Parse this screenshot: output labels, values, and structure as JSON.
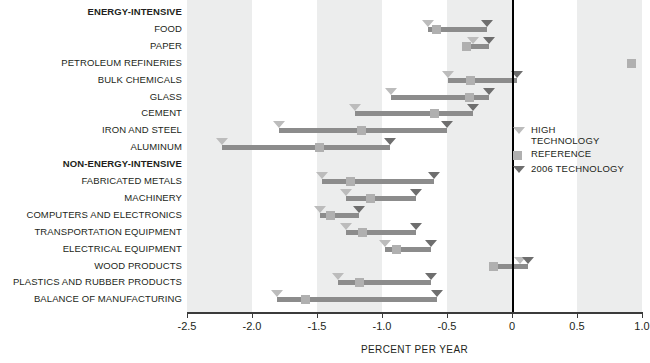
{
  "chart_data": {
    "type": "bar",
    "title": "",
    "xlabel": "PERCENT PER YEAR",
    "ylabel": "",
    "xlim": [
      -2.5,
      1.0
    ],
    "xticks": [
      -2.5,
      -2.0,
      -1.5,
      -1.0,
      -0.5,
      0,
      0.5,
      1.0
    ],
    "xticklabels": [
      "-2.5",
      "-2.0",
      "-1.5",
      "-1.0",
      "-0.5",
      "0",
      "0.5",
      "1.0"
    ],
    "grid": false,
    "legend_position": "right-middle",
    "series_names": [
      "HIGH TECHNOLOGY",
      "REFERENCE",
      "2006 TECHNOLOGY"
    ],
    "categories": [
      {
        "label": "ENERGY-INTENSIVE",
        "group": true
      },
      {
        "label": "FOOD",
        "group": false,
        "high": -0.65,
        "reference": -0.58,
        "tech2006": -0.19
      },
      {
        "label": "PAPER",
        "group": false,
        "high": -0.3,
        "reference": -0.35,
        "tech2006": -0.18
      },
      {
        "label": "PETROLEUM REFINERIES",
        "group": false,
        "high": null,
        "reference": 0.92,
        "tech2006": null
      },
      {
        "label": "BULK CHEMICALS",
        "group": false,
        "high": -0.49,
        "reference": -0.32,
        "tech2006": 0.04
      },
      {
        "label": "GLASS",
        "group": false,
        "high": -0.93,
        "reference": -0.33,
        "tech2006": -0.18
      },
      {
        "label": "CEMENT",
        "group": false,
        "high": -1.21,
        "reference": -0.6,
        "tech2006": -0.3
      },
      {
        "label": "IRON AND STEEL",
        "group": false,
        "high": -1.79,
        "reference": -1.16,
        "tech2006": -0.5
      },
      {
        "label": "ALUMINUM",
        "group": false,
        "high": -2.23,
        "reference": -1.48,
        "tech2006": -0.94
      },
      {
        "label": "NON-ENERGY-INTENSIVE",
        "group": true
      },
      {
        "label": "FABRICATED METALS",
        "group": false,
        "high": -1.46,
        "reference": -1.24,
        "tech2006": -0.6
      },
      {
        "label": "MACHINERY",
        "group": false,
        "high": -1.28,
        "reference": -1.09,
        "tech2006": -0.74
      },
      {
        "label": "COMPUTERS AND ELECTRONICS",
        "group": false,
        "high": -1.48,
        "reference": -1.4,
        "tech2006": -1.18
      },
      {
        "label": "TRANSPORTATION EQUIPMENT",
        "group": false,
        "high": -1.28,
        "reference": -1.15,
        "tech2006": -0.74
      },
      {
        "label": "ELECTRICAL EQUIPMENT",
        "group": false,
        "high": -0.98,
        "reference": -0.89,
        "tech2006": -0.62
      },
      {
        "label": "WOOD PRODUCTS",
        "group": false,
        "high": 0.06,
        "reference": -0.14,
        "tech2006": 0.12
      },
      {
        "label": "PLASTICS AND RUBBER PRODUCTS",
        "group": false,
        "high": -1.34,
        "reference": -1.17,
        "tech2006": -0.62
      },
      {
        "label": "BALANCE OF MANUFACTURING",
        "group": false,
        "high": -1.81,
        "reference": -1.59,
        "tech2006": -0.58
      }
    ],
    "bands": [
      [
        -2.5,
        -2.0
      ],
      [
        -1.5,
        -1.0
      ],
      [
        -0.5,
        0.0
      ],
      [
        0.5,
        1.0
      ]
    ]
  },
  "legend": {
    "items": [
      {
        "name": "high-technology",
        "label": "HIGH\nTECHNOLOGY",
        "glyph": "triangle-light-icon",
        "color": "#bcbcbc"
      },
      {
        "name": "reference",
        "label": "REFERENCE",
        "glyph": "square-gray-icon",
        "color": "#b0b0b0"
      },
      {
        "name": "2006-technology",
        "label": "2006 TECHNOLOGY",
        "glyph": "triangle-dark-icon",
        "color": "#6e6e6e"
      }
    ]
  },
  "colors": {
    "band": "#eceded",
    "bar": "#8c8c8c",
    "high": "#bcbcbc",
    "reference": "#b0b0b0",
    "tech2006": "#6e6e6e",
    "text": "#231f20",
    "axis": "#3b3b3b"
  }
}
